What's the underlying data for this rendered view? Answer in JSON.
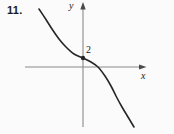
{
  "figure": {
    "problem_number": "11.",
    "x_axis_label": "x",
    "y_axis_label": "y",
    "y_intercept_label": "2"
  },
  "chart_data": {
    "type": "line",
    "title": "",
    "xlabel": "x",
    "ylabel": "y",
    "grid": false,
    "legend": false,
    "y_intercept": 2,
    "x_intercept_approx": 3.3,
    "marked_points": [
      {
        "x": 0,
        "y": 2,
        "label": "2"
      }
    ],
    "series": [
      {
        "name": "curve",
        "x": [
          -9.8,
          -8.4,
          -6.9,
          -5.3,
          -3.8,
          -2.0,
          0.0,
          1.8,
          3.3,
          4.9,
          6.2,
          7.3,
          8.7,
          10.0,
          11.3
        ],
        "y": [
          12.9,
          10.9,
          8.4,
          6.2,
          4.4,
          2.9,
          2.0,
          1.1,
          0.0,
          -2.0,
          -4.2,
          -6.4,
          -8.9,
          -11.1,
          -13.3
        ]
      }
    ],
    "xlim_approx": [
      -13,
      14
    ],
    "ylim_approx": [
      -15,
      14
    ]
  },
  "render": {
    "colors": {
      "background": "#fbfbfb",
      "axis": "#8a8a8a",
      "arrow": "#4a4a4a",
      "curve": "#262626",
      "text": "#1a1a1a"
    },
    "curve_px": [
      [
        39,
        9
      ],
      [
        45,
        18
      ],
      [
        52,
        29
      ],
      [
        59,
        39
      ],
      [
        66,
        47
      ],
      [
        74,
        54
      ],
      [
        83,
        58
      ],
      [
        91,
        62
      ],
      [
        98,
        67
      ],
      [
        105,
        76
      ],
      [
        111,
        86
      ],
      [
        116,
        96
      ],
      [
        122,
        107
      ],
      [
        128,
        117
      ],
      [
        134,
        127
      ]
    ],
    "dot_px": [
      83,
      58
    ]
  }
}
